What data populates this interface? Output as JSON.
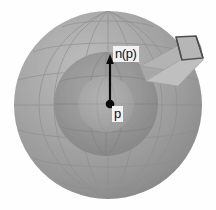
{
  "figure": {
    "background_color": "#fefefe",
    "width": 216,
    "height": 210
  },
  "labels": {
    "normal_vector": "n(p)",
    "point": "p"
  },
  "colors": {
    "background": "#fefefe",
    "sphere_base": "#9a9a9a",
    "sphere_light": "#b4b4b4",
    "sphere_dark": "#7c7c7c",
    "cap_dark": "#8c8c8c",
    "cap_inner_light": "#a8a8a8",
    "grid_line": "#8a8a8a",
    "box_top": "#b0b0b0",
    "box_side": "#9e9e9e",
    "box_front": "#c0c0c0",
    "box_outline": "#4a4a4a",
    "arrow": "#0a0a0a",
    "label_background": "#f2f2f0",
    "label_text": "#111111"
  },
  "geometry": {
    "sphere": {
      "cx": 108,
      "cy": 105,
      "r": 94
    },
    "cap_outer": {
      "cx": 106,
      "cy": 104,
      "r": 52
    },
    "cap_inner": {
      "cx": 106,
      "cy": 104,
      "r": 28
    },
    "point_p": {
      "x": 110,
      "y": 104,
      "r": 4.2
    },
    "arrow": {
      "x1": 110,
      "y1": 104,
      "x2": 110,
      "y2": 56
    },
    "box": {
      "origin_x": 140,
      "origin_y": 82,
      "end_x": 201,
      "end_y": 46
    }
  }
}
